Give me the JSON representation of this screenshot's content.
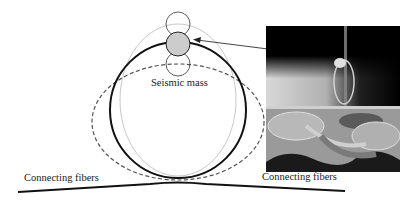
{
  "figure": {
    "labels": {
      "seismic_mass": "Seismic mass",
      "connecting_fibers_left": "Connecting fibers",
      "connecting_fibers_right": "Connecting fibers"
    },
    "elements": {
      "ring_solid": "solid black ring (rest state)",
      "ring_dashed": "dashed ellipse (deformed state, horizontally elongated)",
      "ring_gray": "light gray ellipse (deformed state, vertically elongated)",
      "mass_center": "gray filled circle at top of ring",
      "mass_upper": "outline circle above mass (displaced position)",
      "mass_lower": "outline circle below mass (displaced position)",
      "arrow": "arrow from photograph to seismic mass",
      "photo": "photograph of fabricated ring resonator with fiber"
    },
    "colors": {
      "ring": "#111111",
      "dashed_ring": "#555555",
      "gray_ring": "#c8c8c8",
      "mass_fill": "#cccccc",
      "photo_top_bg": "#000000",
      "photo_bottom_bg": "#9a9a9a"
    }
  }
}
